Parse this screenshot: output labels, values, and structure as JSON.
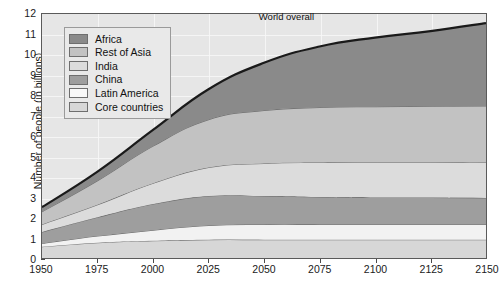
{
  "chart_data": {
    "type": "area",
    "title": "",
    "xlabel": "",
    "ylabel": "Number of people (in billions)",
    "xlim": [
      1950,
      2150
    ],
    "ylim": [
      0,
      12
    ],
    "grid": true,
    "stacked": true,
    "legend_position": "top-left",
    "annotations": [
      {
        "text": "World overall",
        "x": 2060,
        "y": 11.9
      }
    ],
    "x_ticks": [
      1950,
      1975,
      2000,
      2025,
      2050,
      2075,
      2100,
      2125,
      2150
    ],
    "y_ticks": [
      0,
      1,
      2,
      3,
      4,
      5,
      6,
      7,
      8,
      9,
      10,
      11,
      12
    ],
    "x": [
      1950,
      1975,
      2000,
      2025,
      2050,
      2075,
      2100,
      2125,
      2150
    ],
    "series": [
      {
        "name": "Core countries",
        "color": "#d7d7d7",
        "values": [
          0.55,
          0.75,
          0.85,
          0.9,
          0.9,
          0.9,
          0.9,
          0.9,
          0.9
        ]
      },
      {
        "name": "Latin America",
        "color": "#f2f2f2",
        "values": [
          0.17,
          0.33,
          0.52,
          0.7,
          0.75,
          0.75,
          0.75,
          0.75,
          0.75
        ]
      },
      {
        "name": "China",
        "color": "#9e9e9e",
        "values": [
          0.56,
          0.92,
          1.28,
          1.45,
          1.4,
          1.35,
          1.33,
          1.32,
          1.3
        ]
      },
      {
        "name": "India",
        "color": "#dcdcdc",
        "values": [
          0.37,
          0.62,
          1.02,
          1.4,
          1.6,
          1.7,
          1.73,
          1.74,
          1.75
        ]
      },
      {
        "name": "Rest of Asia",
        "color": "#c2c2c2",
        "values": [
          0.62,
          1.18,
          1.83,
          2.35,
          2.6,
          2.7,
          2.73,
          2.75,
          2.77
        ]
      },
      {
        "name": "Africa",
        "color": "#8a8a8a",
        "values": [
          0.23,
          0.45,
          0.8,
          1.5,
          2.35,
          3.0,
          3.4,
          3.7,
          4.08
        ]
      }
    ],
    "total_label": "World overall",
    "totals": [
      2.5,
      4.25,
      6.3,
      8.3,
      9.6,
      10.4,
      10.84,
      11.16,
      11.55
    ],
    "legend_entries": [
      {
        "label": "Africa",
        "color": "#8a8a8a"
      },
      {
        "label": "Rest of Asia",
        "color": "#c2c2c2"
      },
      {
        "label": "India",
        "color": "#dcdcdc"
      },
      {
        "label": "China",
        "color": "#9e9e9e"
      },
      {
        "label": "Latin America",
        "color": "#f8f8f8"
      },
      {
        "label": "Core countries",
        "color": "#d7d7d7"
      }
    ],
    "style": {
      "plot_background": "#e6e6e6",
      "gridline_color": "#f7f7f7",
      "axis_color": "#5a5a5a",
      "top_outline_color": "#1a1a1a",
      "band_outline_color": "#6f6f6f"
    }
  }
}
